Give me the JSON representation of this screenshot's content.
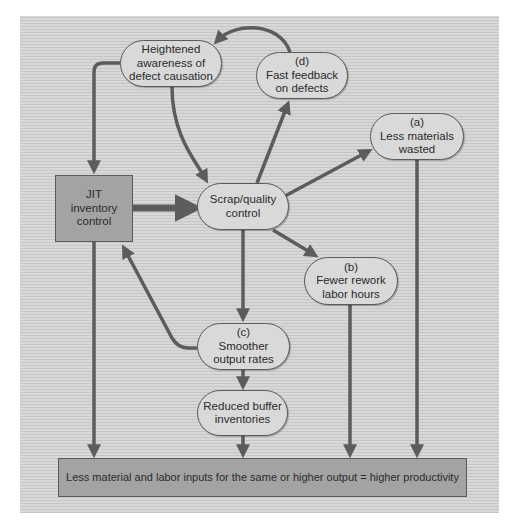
{
  "diagram": {
    "colors": {
      "background": "#d3d3d3",
      "node_fill": "#d9d9d9",
      "box_fill": "#a3a3a3",
      "arrow": "#5c5c5c",
      "border": "#5a5a5a"
    },
    "nodes": {
      "heightened": {
        "lines": [
          "Heightened",
          "awareness of",
          "defect causation"
        ]
      },
      "fast_feedback": {
        "tag": "(d)",
        "lines": [
          "Fast feedback",
          "on defects"
        ]
      },
      "less_materials": {
        "tag": "(a)",
        "lines": [
          "Less materials",
          "wasted"
        ]
      },
      "jit": {
        "lines": [
          "JIT",
          "inventory",
          "control"
        ]
      },
      "scrap": {
        "lines": [
          "Scrap/quality",
          "control"
        ]
      },
      "fewer_rework": {
        "tag": "(b)",
        "lines": [
          "Fewer rework",
          "labor hours"
        ]
      },
      "smoother": {
        "tag": "(c)",
        "lines": [
          "Smoother",
          "output rates"
        ]
      },
      "reduced_buffer": {
        "lines": [
          "Reduced buffer",
          "inventories"
        ]
      },
      "productivity": {
        "text": "Less material and labor inputs for the same or higher output = higher productivity"
      }
    },
    "edges": [
      {
        "from": "jit",
        "to": "scrap"
      },
      {
        "from": "scrap",
        "to": "fast_feedback"
      },
      {
        "from": "scrap",
        "to": "less_materials"
      },
      {
        "from": "scrap",
        "to": "fewer_rework"
      },
      {
        "from": "scrap",
        "to": "smoother"
      },
      {
        "from": "fast_feedback",
        "to": "heightened"
      },
      {
        "from": "heightened",
        "to": "jit"
      },
      {
        "from": "heightened",
        "to": "scrap"
      },
      {
        "from": "smoother",
        "to": "jit"
      },
      {
        "from": "smoother",
        "to": "reduced_buffer"
      },
      {
        "from": "jit",
        "to": "productivity"
      },
      {
        "from": "reduced_buffer",
        "to": "productivity"
      },
      {
        "from": "fewer_rework",
        "to": "productivity"
      },
      {
        "from": "less_materials",
        "to": "productivity"
      }
    ]
  }
}
